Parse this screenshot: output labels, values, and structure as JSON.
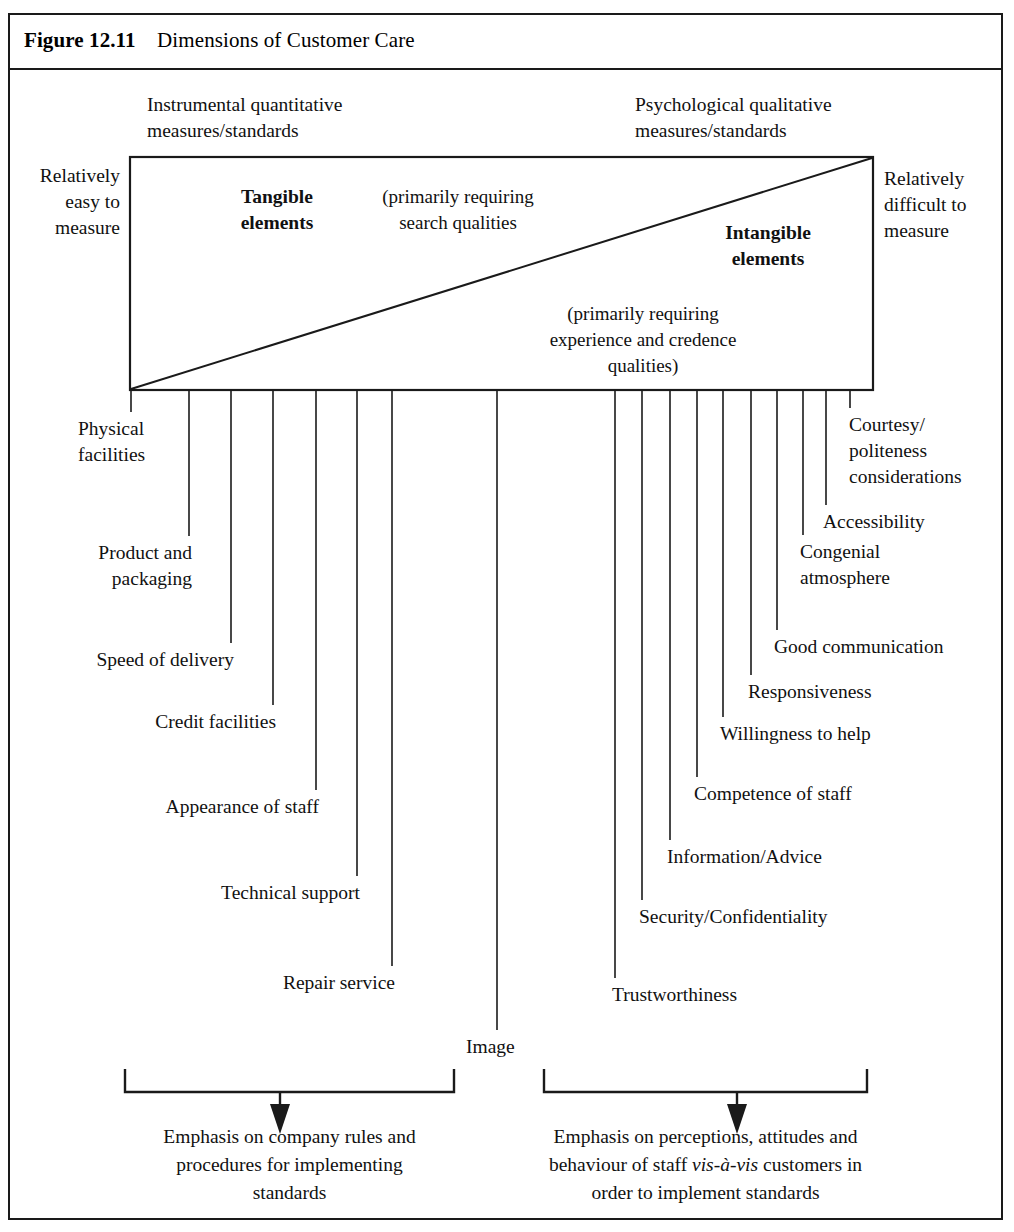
{
  "figure": {
    "number": "Figure 12.11",
    "caption": "Dimensions of Customer Care"
  },
  "header_labels": {
    "left": [
      "Instrumental quantitative",
      "measures/standards"
    ],
    "right": [
      "Psychological qualitative",
      "measures/standards"
    ]
  },
  "side_labels": {
    "left": [
      "Relatively",
      "easy to",
      "measure"
    ],
    "right": [
      "Relatively",
      "difficult to",
      "measure"
    ]
  },
  "box_labels": {
    "tangible": [
      "Tangible",
      "elements"
    ],
    "tangible_note": [
      "(primarily requiring",
      "search qualities"
    ],
    "intangible": [
      "Intangible",
      "elements"
    ],
    "intangible_note": [
      "(primarily requiring",
      "experience and credence",
      "qualities)"
    ]
  },
  "dimensions": [
    {
      "id": "physical-facilities",
      "lines": [
        "Physical",
        "facilities"
      ],
      "side": "left",
      "tick_x": 131,
      "drop_y": 412,
      "text_x": 78,
      "text_y": 435,
      "anchor": "start"
    },
    {
      "id": "product-and-packaging",
      "lines": [
        "Product and",
        "packaging"
      ],
      "side": "left",
      "tick_x": 189,
      "drop_y": 536,
      "text_x": 192,
      "text_y": 559,
      "anchor": "end"
    },
    {
      "id": "speed-of-delivery",
      "lines": [
        "Speed of delivery"
      ],
      "side": "left",
      "tick_x": 231,
      "drop_y": 643,
      "text_x": 234,
      "text_y": 666,
      "anchor": "end"
    },
    {
      "id": "credit-facilities",
      "lines": [
        "Credit facilities"
      ],
      "side": "left",
      "tick_x": 273,
      "drop_y": 705,
      "text_x": 276,
      "text_y": 728,
      "anchor": "end"
    },
    {
      "id": "appearance-of-staff",
      "lines": [
        "Appearance of staff"
      ],
      "side": "left",
      "tick_x": 316,
      "drop_y": 790,
      "text_x": 319,
      "text_y": 813,
      "anchor": "end"
    },
    {
      "id": "technical-support",
      "lines": [
        "Technical support"
      ],
      "side": "left",
      "tick_x": 357,
      "drop_y": 876,
      "text_x": 360,
      "text_y": 899,
      "anchor": "end"
    },
    {
      "id": "repair-service",
      "lines": [
        "Repair service"
      ],
      "side": "left",
      "tick_x": 392,
      "drop_y": 966,
      "text_x": 395,
      "text_y": 989,
      "anchor": "end"
    },
    {
      "id": "image",
      "lines": [
        "Image"
      ],
      "side": "left",
      "tick_x": 497,
      "drop_y": 1030,
      "text_x": 466,
      "text_y": 1053,
      "anchor": "start"
    },
    {
      "id": "trustworthiness",
      "lines": [
        "Trustworthiness"
      ],
      "side": "right",
      "tick_x": 615,
      "drop_y": 978,
      "text_x": 612,
      "text_y": 1001,
      "anchor": "start"
    },
    {
      "id": "security-confidentiality",
      "lines": [
        "Security/Confidentiality"
      ],
      "side": "right",
      "tick_x": 642,
      "drop_y": 900,
      "text_x": 639,
      "text_y": 923,
      "anchor": "start"
    },
    {
      "id": "information-advice",
      "lines": [
        "Information/Advice"
      ],
      "side": "right",
      "tick_x": 670,
      "drop_y": 840,
      "text_x": 667,
      "text_y": 863,
      "anchor": "start"
    },
    {
      "id": "competence-of-staff",
      "lines": [
        "Competence of staff"
      ],
      "side": "right",
      "tick_x": 697,
      "drop_y": 777,
      "text_x": 694,
      "text_y": 800,
      "anchor": "start"
    },
    {
      "id": "willingness-to-help",
      "lines": [
        "Willingness to help"
      ],
      "side": "right",
      "tick_x": 723,
      "drop_y": 717,
      "text_x": 720,
      "text_y": 740,
      "anchor": "start"
    },
    {
      "id": "responsiveness",
      "lines": [
        "Responsiveness"
      ],
      "side": "right",
      "tick_x": 751,
      "drop_y": 675,
      "text_x": 748,
      "text_y": 698,
      "anchor": "start"
    },
    {
      "id": "good-communication",
      "lines": [
        "Good communication"
      ],
      "side": "right",
      "tick_x": 777,
      "drop_y": 630,
      "text_x": 774,
      "text_y": 653,
      "anchor": "start"
    },
    {
      "id": "congenial-atmosphere",
      "lines": [
        "Congenial",
        "atmosphere"
      ],
      "side": "right",
      "tick_x": 803,
      "drop_y": 535,
      "text_x": 800,
      "text_y": 558,
      "anchor": "start"
    },
    {
      "id": "accessibility",
      "lines": [
        "Accessibility"
      ],
      "side": "right",
      "tick_x": 826,
      "drop_y": 505,
      "text_x": 823,
      "text_y": 528,
      "anchor": "start"
    },
    {
      "id": "courtesy-politeness",
      "lines": [
        "Courtesy/",
        "politeness",
        "considerations"
      ],
      "side": "right",
      "tick_x": 850,
      "drop_y": 408,
      "text_x": 849,
      "text_y": 431,
      "anchor": "start"
    }
  ],
  "brackets": [
    {
      "id": "left-bracket",
      "x1": 125,
      "x2": 454,
      "arrow_x": 280,
      "lines": [
        [
          {
            "t": "Emphasis on company rules and",
            "i": false
          }
        ],
        [
          {
            "t": "procedures for implementing",
            "i": false
          }
        ],
        [
          {
            "t": "standards",
            "i": false
          }
        ]
      ]
    },
    {
      "id": "right-bracket",
      "x1": 544,
      "x2": 867,
      "arrow_x": 737,
      "lines": [
        [
          {
            "t": "Emphasis on perceptions, attitudes and",
            "i": false
          }
        ],
        [
          {
            "t": "behaviour of staff ",
            "i": false
          },
          {
            "t": "vis-à-vis",
            "i": true
          },
          {
            "t": " customers in",
            "i": false
          }
        ],
        [
          {
            "t": "order to implement standards",
            "i": false
          }
        ]
      ]
    }
  ],
  "geometry": {
    "box_left": 130,
    "box_right": 873,
    "box_top": 157,
    "box_bottom": 390,
    "bracket_top_y": 1069,
    "bracket_bar_y": 1092,
    "bracket_text_start_y": 1143
  },
  "colors": {
    "ink": "#1a1a1a",
    "paper": "#ffffff"
  }
}
